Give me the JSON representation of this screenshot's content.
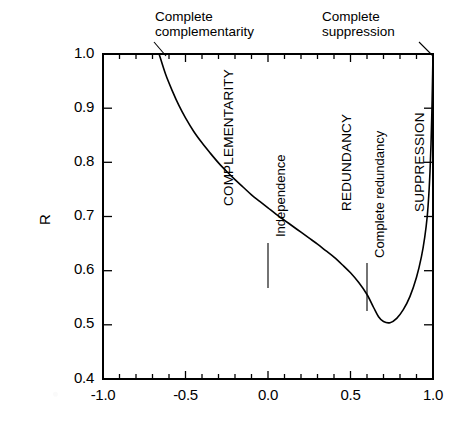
{
  "chart_data": {
    "type": "line",
    "title": "",
    "subtitle": "",
    "xlabel": "",
    "ylabel": "R",
    "xlim": [
      -1.0,
      1.0
    ],
    "ylim": [
      0.4,
      1.0
    ],
    "grid": false,
    "legend": "none",
    "x_ticks": [
      "-1.0",
      "-0.5",
      "0.0",
      "0.5",
      "1.0"
    ],
    "x_tick_values": [
      -1.0,
      -0.5,
      0.0,
      0.5,
      1.0
    ],
    "x_minor_per_major": 4,
    "y_ticks": [
      "1.0",
      "0.9",
      "0.8",
      "0.7",
      "0.6",
      "0.5",
      "0.4"
    ],
    "y_tick_values": [
      1.0,
      0.9,
      0.8,
      0.7,
      0.6,
      0.5,
      0.4
    ],
    "series": [
      {
        "name": "R",
        "x": [
          -0.66,
          -0.62,
          -0.58,
          -0.54,
          -0.5,
          -0.45,
          -0.4,
          -0.35,
          -0.3,
          -0.25,
          -0.2,
          -0.15,
          -0.1,
          -0.05,
          0.0,
          0.05,
          0.1,
          0.15,
          0.2,
          0.25,
          0.3,
          0.35,
          0.4,
          0.45,
          0.5,
          0.55,
          0.6,
          0.64,
          0.67,
          0.7,
          0.74,
          0.78,
          0.82,
          0.86,
          0.9,
          0.93,
          0.95,
          0.965,
          0.975,
          0.982,
          0.988,
          0.993,
          0.997,
          1.0
        ],
        "y": [
          1.0,
          0.962,
          0.932,
          0.905,
          0.882,
          0.857,
          0.836,
          0.817,
          0.799,
          0.783,
          0.768,
          0.754,
          0.74,
          0.728,
          0.716,
          0.704,
          0.693,
          0.682,
          0.671,
          0.66,
          0.649,
          0.637,
          0.625,
          0.611,
          0.596,
          0.578,
          0.556,
          0.532,
          0.515,
          0.506,
          0.504,
          0.512,
          0.528,
          0.552,
          0.588,
          0.626,
          0.662,
          0.7,
          0.742,
          0.784,
          0.834,
          0.89,
          0.95,
          1.0
        ]
      }
    ],
    "annotations": [
      {
        "id": "complete-complementarity",
        "text_line1": "Complete",
        "text_line2": "complementarity",
        "x": -0.66,
        "y": 1.0,
        "leader": "down-left"
      },
      {
        "id": "complete-suppression",
        "text_line1": "Complete",
        "text_line2": "suppression",
        "x": 1.0,
        "y": 1.0,
        "leader": "down-right"
      },
      {
        "id": "complementarity-region",
        "text": "COMPLEMENTARITY",
        "orientation": "vertical"
      },
      {
        "id": "independence",
        "text": "Independence",
        "orientation": "vertical",
        "x": 0.0,
        "leader": "vertical-line"
      },
      {
        "id": "redundancy-region",
        "text": "REDUNDANCY",
        "orientation": "vertical"
      },
      {
        "id": "complete-redundancy",
        "text": "Complete redundancy",
        "orientation": "vertical",
        "x": 0.6,
        "leader": "vertical-line"
      },
      {
        "id": "suppression-region",
        "text": "SUPPRESSION",
        "orientation": "vertical"
      }
    ],
    "colors": {
      "curve": "#000000",
      "axis": "#000000",
      "background": "#ffffff"
    }
  },
  "axes": {
    "y_title": "R",
    "y_tick_labels": [
      "1.0",
      "0.9",
      "0.8",
      "0.7",
      "0.6",
      "0.5",
      "0.4"
    ],
    "x_tick_labels": [
      "-1.0",
      "-0.5",
      "0.0",
      "0.5",
      "1.0"
    ]
  },
  "callouts": {
    "complementarity": {
      "line1": "Complete",
      "line2": "complementarity"
    },
    "suppression": {
      "line1": "Complete",
      "line2": "suppression"
    }
  },
  "regions": {
    "complementarity": "COMPLEMENTARITY",
    "independence": "Independence",
    "redundancy": "REDUNDANCY",
    "complete_redundancy": "Complete redundancy",
    "suppression": "SUPPRESSION"
  }
}
